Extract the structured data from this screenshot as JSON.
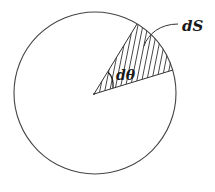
{
  "diagram": {
    "labels": {
      "area_element": "dS",
      "angle_element": "dθ"
    },
    "colors": {
      "stroke": "#333333",
      "background": "#ffffff",
      "text": "#1a1a1a"
    },
    "geometry": {
      "circle_center": [
        95,
        93
      ],
      "circle_radius": 81,
      "sector_apex": [
        94,
        94
      ],
      "sector_edge_points": [
        [
          137,
          24
        ],
        [
          173,
          70
        ]
      ]
    }
  }
}
